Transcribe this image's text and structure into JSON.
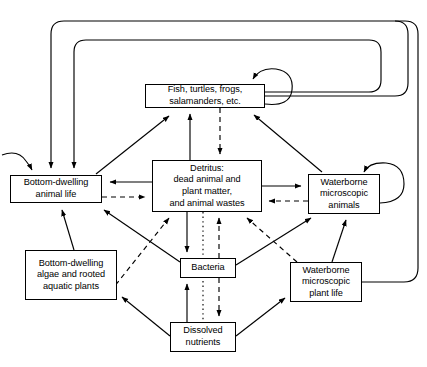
{
  "diagram": {
    "type": "flow-diagram",
    "background_color": "#ffffff",
    "line_color": "#000000",
    "nodes": [
      {
        "id": "fish",
        "label": "Fish, turtles, frogs,\nsalamanders, etc.",
        "x": 145,
        "y": 84,
        "w": 120,
        "h": 24
      },
      {
        "id": "detritus",
        "label": "Detritus:\ndead animal and\nplant matter,\nand animal wastes",
        "x": 152,
        "y": 160,
        "w": 110,
        "h": 52
      },
      {
        "id": "bottom_animals",
        "label": "Bottom-dwelling\nanimal life",
        "x": 10,
        "y": 175,
        "w": 92,
        "h": 28
      },
      {
        "id": "waterborne_animals",
        "label": "Waterborne\nmicroscopic\nanimals",
        "x": 308,
        "y": 174,
        "w": 72,
        "h": 40
      },
      {
        "id": "bottom_plants",
        "label": "Bottom-dwelling\nalgae and rooted\naquatic plants",
        "x": 25,
        "y": 250,
        "w": 92,
        "h": 50
      },
      {
        "id": "bacteria",
        "label": "Bacteria",
        "x": 180,
        "y": 258,
        "w": 56,
        "h": 20
      },
      {
        "id": "waterborne_plants",
        "label": "Waterborne\nmicroscopic\nplant life",
        "x": 290,
        "y": 262,
        "w": 72,
        "h": 40
      },
      {
        "id": "dissolved_nutrients",
        "label": "Dissolved\nnutrients",
        "x": 170,
        "y": 322,
        "w": 66,
        "h": 30
      }
    ],
    "edge_styles": {
      "solid": "solid line with filled arrowhead",
      "dashed": "dashed line with filled arrowhead",
      "dotted": "dotted line, no arrowhead"
    },
    "edges": [
      {
        "from": "detritus",
        "to": "fish",
        "style": "solid"
      },
      {
        "from": "fish",
        "to": "detritus",
        "style": "dashed"
      },
      {
        "from": "fish",
        "to": "fish",
        "style": "solid",
        "note": "self loop, top right"
      },
      {
        "from": "bottom_animals",
        "to": "fish",
        "style": "solid"
      },
      {
        "from": "waterborne_animals",
        "to": "fish",
        "style": "solid"
      },
      {
        "from": "detritus",
        "to": "bottom_animals",
        "style": "solid"
      },
      {
        "from": "bottom_animals",
        "to": "detritus",
        "style": "dashed"
      },
      {
        "from": "detritus",
        "to": "waterborne_animals",
        "style": "solid"
      },
      {
        "from": "waterborne_animals",
        "to": "detritus",
        "style": "dashed"
      },
      {
        "from": "waterborne_animals",
        "to": "waterborne_animals",
        "style": "solid",
        "note": "self loop, right"
      },
      {
        "from": "bottom_animals",
        "to": "bottom_animals",
        "style": "solid",
        "note": "self loop, left"
      },
      {
        "from": "detritus",
        "to": "bacteria",
        "style": "solid"
      },
      {
        "from": "bacteria",
        "to": "detritus",
        "style": "dashed"
      },
      {
        "from": "detritus",
        "to": "dissolved_nutrients",
        "style": "dotted"
      },
      {
        "from": "dissolved_nutrients",
        "to": "bacteria",
        "style": "solid"
      },
      {
        "from": "bacteria",
        "to": "dissolved_nutrients",
        "style": "dashed"
      },
      {
        "from": "bacteria",
        "to": "bottom_animals",
        "style": "solid"
      },
      {
        "from": "bacteria",
        "to": "waterborne_animals",
        "style": "solid"
      },
      {
        "from": "bottom_plants",
        "to": "bottom_animals",
        "style": "solid"
      },
      {
        "from": "bottom_plants",
        "to": "detritus",
        "style": "dashed"
      },
      {
        "from": "waterborne_plants",
        "to": "detritus",
        "style": "dashed"
      },
      {
        "from": "waterborne_plants",
        "to": "waterborne_animals",
        "style": "solid"
      },
      {
        "from": "dissolved_nutrients",
        "to": "bottom_plants",
        "style": "solid"
      },
      {
        "from": "dissolved_nutrients",
        "to": "waterborne_plants",
        "style": "solid"
      },
      {
        "from": "fish",
        "to": "bottom_animals",
        "style": "solid",
        "note": "outer loop, outermost"
      },
      {
        "from": "fish",
        "to": "bottom_animals",
        "style": "solid",
        "note": "outer loop, inner"
      },
      {
        "from": "waterborne_plants",
        "to": "bottom_animals",
        "style": "solid",
        "note": "outer loop far right"
      }
    ]
  }
}
